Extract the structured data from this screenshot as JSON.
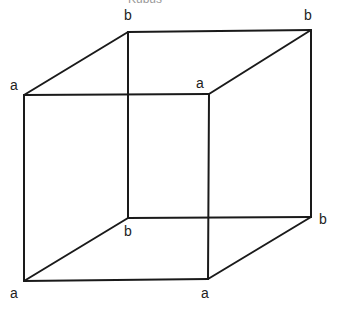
{
  "caption": "Kubus",
  "vertices": {
    "front_top_left": {
      "x": 24,
      "y": 95,
      "label": "a",
      "lx": 10,
      "ly": 90
    },
    "front_top_right": {
      "x": 209,
      "y": 94,
      "label": "a",
      "lx": 196,
      "ly": 88
    },
    "back_top_left": {
      "x": 128,
      "y": 32,
      "label": "b",
      "lx": 124,
      "ly": 20
    },
    "back_top_right": {
      "x": 311,
      "y": 30,
      "label": "b",
      "lx": 304,
      "ly": 20
    },
    "back_bottom_left": {
      "x": 128,
      "y": 218,
      "label": "b",
      "lx": 124,
      "ly": 236
    },
    "back_bottom_right": {
      "x": 311,
      "y": 217,
      "label": "b",
      "lx": 319,
      "ly": 224
    },
    "front_bottom_left": {
      "x": 24,
      "y": 281,
      "label": "a",
      "lx": 10,
      "ly": 298
    },
    "front_bottom_right": {
      "x": 208,
      "y": 279,
      "label": "a",
      "lx": 201,
      "ly": 298
    }
  },
  "edges": [
    [
      "front_top_left",
      "front_top_right"
    ],
    [
      "front_top_left",
      "front_bottom_left"
    ],
    [
      "front_top_right",
      "front_bottom_right"
    ],
    [
      "front_bottom_left",
      "front_bottom_right"
    ],
    [
      "back_top_left",
      "back_top_right"
    ],
    [
      "back_top_left",
      "back_bottom_left"
    ],
    [
      "back_top_right",
      "back_bottom_right"
    ],
    [
      "back_bottom_left",
      "back_bottom_right"
    ],
    [
      "front_top_left",
      "back_top_left"
    ],
    [
      "front_top_right",
      "back_top_right"
    ],
    [
      "front_bottom_left",
      "back_bottom_left"
    ],
    [
      "front_bottom_right",
      "back_bottom_right"
    ]
  ],
  "labels": {
    "a1": "a",
    "a2": "a",
    "a3": "a",
    "a4": "a",
    "b1": "b",
    "b2": "b",
    "b3": "b",
    "b4": "b"
  }
}
